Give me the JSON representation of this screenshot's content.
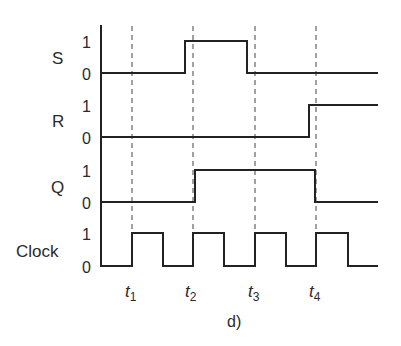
{
  "diagram": {
    "type": "timing-diagram",
    "caption": "d)",
    "level_labels": {
      "high": "1",
      "low": "0"
    },
    "signals": [
      {
        "id": "S",
        "label": "S",
        "initial": 0,
        "transitions": [
          {
            "at": "between t1 and t2 (just before t2)",
            "to": 1
          },
          {
            "at": "between t2 and t3 (just before t3)",
            "to": 0
          }
        ]
      },
      {
        "id": "R",
        "label": "R",
        "initial": 0,
        "transitions": [
          {
            "at": "just before t4",
            "to": 1
          }
        ]
      },
      {
        "id": "Q",
        "label": "Q",
        "initial": 0,
        "transitions": [
          {
            "at": "t2",
            "to": 1
          },
          {
            "at": "t4",
            "to": 0
          }
        ]
      },
      {
        "id": "Clock",
        "label": "Clock",
        "initial": 0,
        "pulses": 4,
        "rising_edges": [
          "t1",
          "t2",
          "t3",
          "t4"
        ]
      }
    ],
    "time_markers": [
      {
        "base": "t",
        "sub": "1"
      },
      {
        "base": "t",
        "sub": "2"
      },
      {
        "base": "t",
        "sub": "3"
      },
      {
        "base": "t",
        "sub": "4"
      }
    ]
  },
  "colors": {
    "waveform": "#222222",
    "guide_lines": "#8a8a8a",
    "text": "#2a2a2a",
    "background": "#ffffff"
  }
}
